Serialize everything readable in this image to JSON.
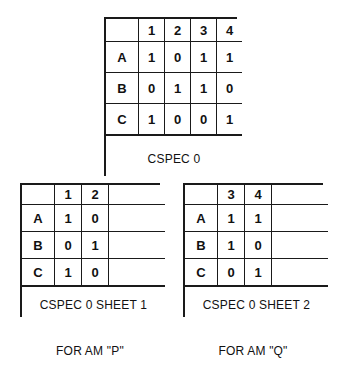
{
  "figure": {
    "background_color": "#ffffff",
    "ink_color": "#1a1a1a"
  },
  "tables": {
    "cspec0": {
      "name": "CSPEC 0",
      "corner": "",
      "column_headers": [
        "1",
        "2",
        "3",
        "4"
      ],
      "row_labels": [
        "A",
        "B",
        "C"
      ],
      "rows": [
        [
          "1",
          "0",
          "1",
          "1"
        ],
        [
          "0",
          "1",
          "1",
          "0"
        ],
        [
          "1",
          "0",
          "0",
          "1"
        ]
      ],
      "caption": "CSPEC 0"
    },
    "sheet1": {
      "name": "CSPEC 0 SHEET 1",
      "corner": "",
      "column_headers": [
        "1",
        "2"
      ],
      "blank_header": "",
      "row_labels": [
        "A",
        "B",
        "C"
      ],
      "rows": [
        [
          "1",
          "0",
          ""
        ],
        [
          "0",
          "1",
          ""
        ],
        [
          "1",
          "0",
          ""
        ]
      ],
      "caption": "CSPEC 0 SHEET 1",
      "sub_caption": "FOR AM \"P\""
    },
    "sheet2": {
      "name": "CSPEC 0 SHEET 2",
      "corner": "",
      "column_headers": [
        "3",
        "4"
      ],
      "blank_header": "",
      "row_labels": [
        "A",
        "B",
        "C"
      ],
      "rows": [
        [
          "1",
          "1",
          ""
        ],
        [
          "1",
          "0",
          ""
        ],
        [
          "0",
          "1",
          ""
        ]
      ],
      "caption": "CSPEC 0 SHEET 2",
      "sub_caption": "FOR AM \"Q\""
    }
  }
}
